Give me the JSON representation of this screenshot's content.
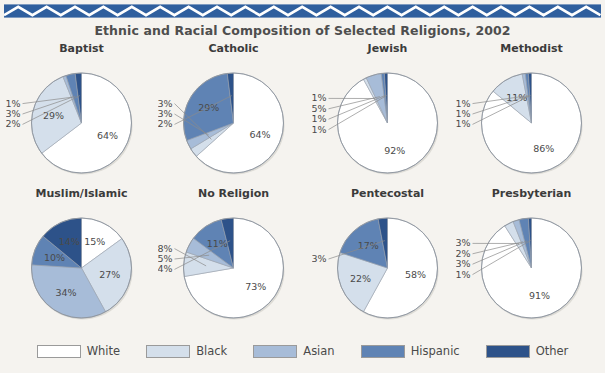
{
  "banner": {
    "name": "zigzag-banner",
    "color": "#2f5f9e",
    "accent": "#ffffff"
  },
  "header": {
    "title": "Ethnic and Racial Composition of Selected Religions, 2002"
  },
  "legend": {
    "position": "bottom",
    "items": [
      {
        "label": "White",
        "color": "#ffffff"
      },
      {
        "label": "Black",
        "color": "#d4dfeb"
      },
      {
        "label": "Asian",
        "color": "#a7bcd8"
      },
      {
        "label": "Hispanic",
        "color": "#5f83b4"
      },
      {
        "label": "Other",
        "color": "#2d5289"
      }
    ]
  },
  "chart_data": {
    "type": "pie",
    "title": "Ethnic and Racial Composition of Selected Religions, 2002",
    "xlabel": "",
    "ylabel": "",
    "categories": [
      "White",
      "Black",
      "Asian",
      "Hispanic",
      "Other"
    ],
    "colors": [
      "#ffffff",
      "#d4dfeb",
      "#a7bcd8",
      "#5f83b4",
      "#2d5289"
    ],
    "units": "percent",
    "charts": [
      {
        "title": "Baptist",
        "values": [
          64,
          29,
          1,
          3,
          2
        ],
        "labels": [
          "64%",
          "29%",
          "1%",
          "3%",
          "2%"
        ]
      },
      {
        "title": "Catholic",
        "values": [
          64,
          3,
          3,
          29,
          2
        ],
        "labels": [
          "64%",
          "3%",
          "3%",
          "29%",
          "2%"
        ]
      },
      {
        "title": "Jewish",
        "values": [
          92,
          1,
          5,
          1,
          1
        ],
        "labels": [
          "92%",
          "1%",
          "5%",
          "1%",
          "1%"
        ]
      },
      {
        "title": "Methodist",
        "values": [
          86,
          11,
          1,
          1,
          1
        ],
        "labels": [
          "86%",
          "11%",
          "1%",
          "1%",
          "1%"
        ]
      },
      {
        "title": "Muslim/Islamic",
        "values": [
          15,
          27,
          34,
          10,
          14
        ],
        "labels": [
          "15%",
          "27%",
          "34%",
          "10%",
          "14%"
        ]
      },
      {
        "title": "No Religion",
        "values": [
          73,
          8,
          5,
          11,
          4
        ],
        "labels": [
          "73%",
          "8%",
          "5%",
          "11%",
          "4%"
        ]
      },
      {
        "title": "Pentecostal",
        "values": [
          58,
          22,
          0,
          17,
          3
        ],
        "labels": [
          "58%",
          "22%",
          "",
          "17%",
          "3%"
        ]
      },
      {
        "title": "Presbyterian",
        "values": [
          91,
          3,
          2,
          3,
          1
        ],
        "labels": [
          "91%",
          "3%",
          "2%",
          "3%",
          "1%"
        ]
      }
    ]
  }
}
